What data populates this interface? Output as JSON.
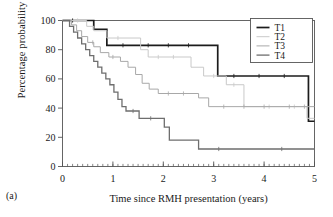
{
  "figure": {
    "panel_label": "(a)",
    "background": "#ffffff"
  },
  "axes": {
    "xlabel": "Time since RMH presentation (years)",
    "ylabel": "Percentage probability of survival",
    "xticks": [
      "0",
      "1",
      "2",
      "3",
      "4",
      "5"
    ],
    "yticks": [
      "0",
      "20",
      "40",
      "60",
      "80",
      "100"
    ],
    "xlim": [
      0,
      5
    ],
    "ylim": [
      0,
      100
    ],
    "xminor_per_major": 10,
    "grid": false,
    "frame_color": "#555555"
  },
  "legend": {
    "position": "top-right",
    "entries": [
      {
        "label": "T1",
        "color": "#1c1c1c",
        "width": 1.7
      },
      {
        "label": "T2",
        "color": "#c9c9c9",
        "width": 1.0
      },
      {
        "label": "T3",
        "color": "#a8a8a8",
        "width": 1.0
      },
      {
        "label": "T4",
        "color": "#6e6e6e",
        "width": 1.3
      }
    ]
  },
  "chart_data": {
    "type": "line",
    "subtype": "kaplan-meier-step",
    "title": "",
    "xlabel": "Time since RMH presentation (years)",
    "ylabel": "Percentage probability of survival",
    "xlim": [
      0,
      5
    ],
    "ylim": [
      0,
      100
    ],
    "xticks": [
      0,
      1,
      2,
      3,
      4,
      5
    ],
    "yticks": [
      0,
      20,
      40,
      60,
      80,
      100
    ],
    "grid": false,
    "legend_position": "top-right",
    "series": [
      {
        "name": "T1",
        "color": "#1c1c1c",
        "width": 1.7,
        "points": [
          [
            0.0,
            100
          ],
          [
            0.62,
            100
          ],
          [
            0.62,
            94
          ],
          [
            0.88,
            94
          ],
          [
            0.88,
            83
          ],
          [
            3.08,
            83
          ],
          [
            3.08,
            62
          ],
          [
            4.88,
            62
          ],
          [
            4.88,
            31
          ],
          [
            5.0,
            31
          ]
        ],
        "censor_marks": [
          0.2,
          1.2,
          1.7,
          2.1,
          2.5,
          3.4,
          3.9,
          4.4
        ]
      },
      {
        "name": "T2",
        "color": "#c9c9c9",
        "width": 1.0,
        "points": [
          [
            0.0,
            100
          ],
          [
            0.48,
            100
          ],
          [
            0.48,
            96
          ],
          [
            0.62,
            96
          ],
          [
            0.62,
            93
          ],
          [
            0.88,
            93
          ],
          [
            0.88,
            88
          ],
          [
            1.55,
            88
          ],
          [
            1.55,
            80
          ],
          [
            1.7,
            80
          ],
          [
            1.7,
            75
          ],
          [
            2.55,
            75
          ],
          [
            2.55,
            68
          ],
          [
            2.8,
            68
          ],
          [
            2.8,
            62
          ],
          [
            3.25,
            62
          ],
          [
            3.25,
            56
          ],
          [
            3.6,
            56
          ],
          [
            3.6,
            41
          ],
          [
            4.85,
            41
          ],
          [
            4.85,
            33
          ],
          [
            5.0,
            33
          ]
        ],
        "censor_marks": [
          0.3,
          1.1,
          1.9,
          2.2,
          3.0,
          3.4,
          4.1,
          4.6
        ]
      },
      {
        "name": "T3",
        "color": "#a8a8a8",
        "width": 1.0,
        "points": [
          [
            0.0,
            100
          ],
          [
            0.18,
            100
          ],
          [
            0.18,
            97
          ],
          [
            0.28,
            97
          ],
          [
            0.28,
            93
          ],
          [
            0.38,
            93
          ],
          [
            0.38,
            89
          ],
          [
            0.5,
            89
          ],
          [
            0.5,
            85
          ],
          [
            0.62,
            85
          ],
          [
            0.62,
            82
          ],
          [
            0.75,
            82
          ],
          [
            0.75,
            78
          ],
          [
            0.92,
            78
          ],
          [
            0.92,
            75
          ],
          [
            1.15,
            75
          ],
          [
            1.15,
            72
          ],
          [
            1.3,
            72
          ],
          [
            1.3,
            68
          ],
          [
            1.45,
            68
          ],
          [
            1.45,
            63
          ],
          [
            1.58,
            63
          ],
          [
            1.58,
            57
          ],
          [
            1.72,
            57
          ],
          [
            1.72,
            53
          ],
          [
            1.9,
            53
          ],
          [
            1.9,
            50
          ],
          [
            2.7,
            50
          ],
          [
            2.7,
            47
          ],
          [
            2.9,
            47
          ],
          [
            2.9,
            41
          ],
          [
            5.0,
            41
          ]
        ],
        "censor_marks": [
          0.6,
          1.0,
          2.1,
          2.4,
          3.2,
          3.6,
          4.0,
          4.5,
          4.8
        ]
      },
      {
        "name": "T4",
        "color": "#6e6e6e",
        "width": 1.3,
        "points": [
          [
            0.0,
            100
          ],
          [
            0.14,
            100
          ],
          [
            0.14,
            96
          ],
          [
            0.22,
            96
          ],
          [
            0.22,
            92
          ],
          [
            0.3,
            92
          ],
          [
            0.3,
            88
          ],
          [
            0.38,
            88
          ],
          [
            0.38,
            84
          ],
          [
            0.46,
            84
          ],
          [
            0.46,
            80
          ],
          [
            0.54,
            80
          ],
          [
            0.54,
            76
          ],
          [
            0.62,
            76
          ],
          [
            0.62,
            72
          ],
          [
            0.7,
            72
          ],
          [
            0.7,
            68
          ],
          [
            0.78,
            68
          ],
          [
            0.78,
            64
          ],
          [
            0.86,
            64
          ],
          [
            0.86,
            60
          ],
          [
            0.94,
            60
          ],
          [
            0.94,
            56
          ],
          [
            1.02,
            56
          ],
          [
            1.02,
            51
          ],
          [
            1.1,
            51
          ],
          [
            1.1,
            46
          ],
          [
            1.18,
            46
          ],
          [
            1.18,
            41
          ],
          [
            1.26,
            41
          ],
          [
            1.26,
            38
          ],
          [
            1.52,
            38
          ],
          [
            1.52,
            33
          ],
          [
            2.02,
            33
          ],
          [
            2.02,
            27
          ],
          [
            2.12,
            27
          ],
          [
            2.12,
            18
          ],
          [
            2.7,
            18
          ],
          [
            2.7,
            12
          ],
          [
            5.0,
            12
          ]
        ],
        "censor_marks": [
          1.4,
          1.75,
          3.1,
          4.35
        ]
      }
    ]
  }
}
